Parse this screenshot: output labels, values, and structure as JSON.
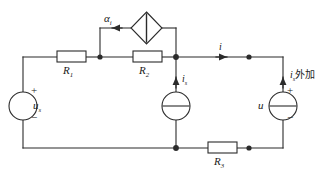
{
  "diagram": {
    "type": "electrical-circuit-schematic",
    "stroke_color": "#2b2b2b",
    "background_color": "#ffffff",
    "components": {
      "source_left": {
        "kind": "independent-voltage-source",
        "symbol": "circle",
        "label": "u",
        "subscript": "s",
        "plus": "+",
        "minus": "−"
      },
      "resistor_1": {
        "kind": "resistor",
        "label": "R",
        "subscript": "1"
      },
      "resistor_2": {
        "kind": "resistor",
        "label": "R",
        "subscript": "2"
      },
      "resistor_3": {
        "kind": "resistor",
        "label": "R",
        "subscript": "3"
      },
      "dependent_source": {
        "kind": "dependent-source",
        "symbol": "diamond",
        "label": "α",
        "subscript": "i"
      },
      "source_middle": {
        "kind": "current-source",
        "symbol": "circle-with-bar",
        "label": "i",
        "subscript": "s"
      },
      "source_right": {
        "kind": "applied-source",
        "symbol": "circle-with-bar",
        "label": "u",
        "plus": "+",
        "minus": "−",
        "annotation_label": "i",
        "annotation_subscript": "s",
        "annotation_text": "外加"
      },
      "current_top": {
        "kind": "current-arrow",
        "label": "i"
      }
    }
  }
}
